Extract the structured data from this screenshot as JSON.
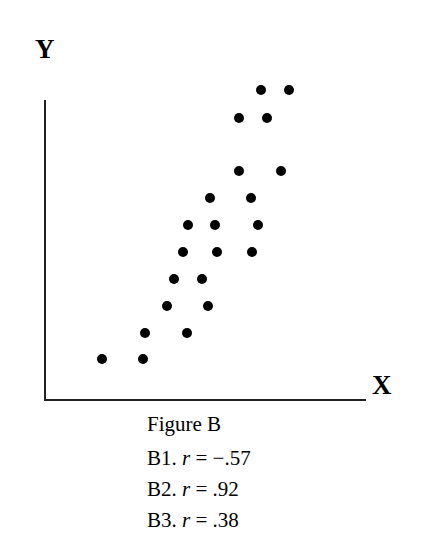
{
  "chart_data": {
    "type": "scatter",
    "title": "Figure B",
    "xlabel": "X",
    "ylabel": "Y",
    "grid": false,
    "ticks": false,
    "pixel_points": [
      {
        "x": 261,
        "y": 90
      },
      {
        "x": 289,
        "y": 90
      },
      {
        "x": 239,
        "y": 118
      },
      {
        "x": 267,
        "y": 118
      },
      {
        "x": 239,
        "y": 171
      },
      {
        "x": 281,
        "y": 171
      },
      {
        "x": 210,
        "y": 198
      },
      {
        "x": 251,
        "y": 198
      },
      {
        "x": 188,
        "y": 225
      },
      {
        "x": 215,
        "y": 225
      },
      {
        "x": 258,
        "y": 225
      },
      {
        "x": 183,
        "y": 252
      },
      {
        "x": 217,
        "y": 252
      },
      {
        "x": 252,
        "y": 252
      },
      {
        "x": 174,
        "y": 279
      },
      {
        "x": 202,
        "y": 279
      },
      {
        "x": 167,
        "y": 306
      },
      {
        "x": 208,
        "y": 306
      },
      {
        "x": 145,
        "y": 333
      },
      {
        "x": 187,
        "y": 333
      },
      {
        "x": 102,
        "y": 359
      },
      {
        "x": 143,
        "y": 359
      }
    ],
    "answer_options": [
      {
        "label": "B1.",
        "r": "−.57"
      },
      {
        "label": "B2.",
        "r": ".92"
      },
      {
        "label": "B3.",
        "r": ".38"
      }
    ]
  },
  "axes": {
    "x_label": "X",
    "y_label": "Y"
  },
  "caption": {
    "title": "Figure B",
    "options": [
      {
        "label": "B1. ",
        "var": "r",
        "eq": " = −.57"
      },
      {
        "label": "B2. ",
        "var": "r",
        "eq": " = .92"
      },
      {
        "label": "B3. ",
        "var": "r",
        "eq": " = .38"
      }
    ]
  }
}
